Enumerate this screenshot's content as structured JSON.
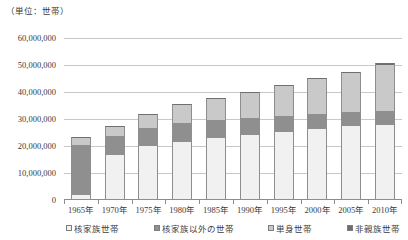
{
  "unit_caption": "（単位：世帯）",
  "chart_data": {
    "type": "bar",
    "subtype": "stacked-column",
    "title": "",
    "subtitle": "",
    "xlabel": "",
    "ylabel": "",
    "unit_note": "（単位：世帯）",
    "grid": true,
    "legend_position": "bottom",
    "ylim": [
      0,
      60000000
    ],
    "ytick_step": 10000000,
    "ytick_labels": [
      "60,000,000",
      "50,000,000",
      "40,000,000",
      "30,000,000",
      "20,000,000",
      "10,000,000",
      "0"
    ],
    "ytick_values": [
      60000000,
      50000000,
      40000000,
      30000000,
      20000000,
      10000000,
      0
    ],
    "categories": [
      "1965年",
      "1970年",
      "1975年",
      "1980年",
      "1985年",
      "1990年",
      "1995年",
      "2000年",
      "2005年",
      "2010年"
    ],
    "series": [
      {
        "name": "核家族世帯",
        "color": "#f1f1f1",
        "values": [
          1800000,
          16800000,
          19900000,
          21600000,
          22800000,
          24000000,
          25200000,
          26200000,
          27300000,
          27900000
        ]
      },
      {
        "name": "核家族以外の世帯",
        "color": "#8f8f8f",
        "values": [
          18600000,
          6900000,
          6600000,
          6800000,
          6700000,
          6200000,
          5800000,
          5700000,
          5300000,
          5200000
        ]
      },
      {
        "name": "単身世帯",
        "color": "#c9c9c9",
        "values": [
          2400000,
          3300000,
          4900000,
          6700000,
          7900000,
          9400000,
          11200000,
          12900000,
          14500000,
          16800000
        ]
      },
      {
        "name": "非親族世帯",
        "color": "#6e6e6e",
        "values": [
          200000,
          200000,
          200000,
          200000,
          200000,
          300000,
          300000,
          400000,
          500000,
          700000
        ]
      }
    ],
    "totals": [
      23000000,
      27200000,
      31600000,
      35300000,
      37600000,
      39900000,
      42500000,
      45200000,
      47600000,
      50600000
    ]
  },
  "legend": {
    "items": [
      {
        "label": "核家族世帯",
        "color": "#f1f1f1"
      },
      {
        "label": "核家族以外の世帯",
        "color": "#8f8f8f"
      },
      {
        "label": "単身世帯",
        "color": "#c9c9c9"
      },
      {
        "label": "非親族世帯",
        "color": "#6e6e6e"
      }
    ]
  }
}
